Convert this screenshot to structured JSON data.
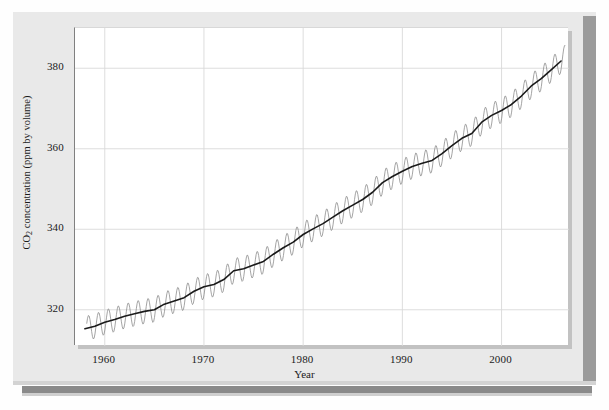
{
  "figure": {
    "x_axis_title": "Year",
    "y_axis_title_main": "CO",
    "y_axis_title_sub": "2",
    "y_axis_title_rest": " concentration (ppm by volume)"
  },
  "colors": {
    "panel_background": "#e9e9e9",
    "plot_background": "#ffffff",
    "gridline": "#d9d9d9",
    "axis": "#808080",
    "monthly_series": "#8d8d8d",
    "trend_series": "#1a1a1a",
    "bottom_rule": "#8a8a8a",
    "text": "#1a1a1a"
  },
  "chart_data": {
    "type": "line",
    "title": "",
    "subtitle": "",
    "xlabel": "Year",
    "ylabel": "CO2 concentration (ppm by volume)",
    "xlim": [
      1957.0,
      2006.8
    ],
    "ylim": [
      311.0,
      390.0
    ],
    "grid": true,
    "legend_position": "none",
    "xticks": [
      1960,
      1970,
      1980,
      1990,
      2000
    ],
    "xtick_labels": [
      "1960",
      "1970",
      "1980",
      "1990",
      "2000"
    ],
    "yticks": [
      320,
      340,
      360,
      380
    ],
    "ytick_labels": [
      "320",
      "340",
      "360",
      "380"
    ],
    "annotations": [],
    "series": [
      {
        "name": "Monthly mean CO2 (seasonal cycle)",
        "color": "#8d8d8d",
        "style": "sawtooth",
        "seasonal_amplitude_ppm": 3.1,
        "note": "Monthly values oscillate about the annual trend; maxima in May, minima in Sept/Oct."
      },
      {
        "name": "Annual trend (smoothed)",
        "color": "#1a1a1a",
        "style": "solid",
        "x": [
          1958,
          1959,
          1960,
          1961,
          1962,
          1963,
          1964,
          1965,
          1966,
          1967,
          1968,
          1969,
          1970,
          1971,
          1972,
          1973,
          1974,
          1975,
          1976,
          1977,
          1978,
          1979,
          1980,
          1981,
          1982,
          1983,
          1984,
          1985,
          1986,
          1987,
          1988,
          1989,
          1990,
          1991,
          1992,
          1993,
          1994,
          1995,
          1996,
          1997,
          1998,
          1999,
          2000,
          2001,
          2002,
          2003,
          2004,
          2005,
          2006
        ],
        "values": [
          315.3,
          315.9,
          316.9,
          317.6,
          318.4,
          319.0,
          319.6,
          320.0,
          321.4,
          322.2,
          323.0,
          324.6,
          325.7,
          326.3,
          327.5,
          329.7,
          330.2,
          331.1,
          332.0,
          333.8,
          335.4,
          336.8,
          338.7,
          340.1,
          341.4,
          343.0,
          344.6,
          346.0,
          347.4,
          349.2,
          351.6,
          353.1,
          354.4,
          355.6,
          356.4,
          357.1,
          358.8,
          360.8,
          362.6,
          363.8,
          366.6,
          368.3,
          369.5,
          371.0,
          373.1,
          375.6,
          377.4,
          379.6,
          381.8
        ]
      }
    ]
  }
}
